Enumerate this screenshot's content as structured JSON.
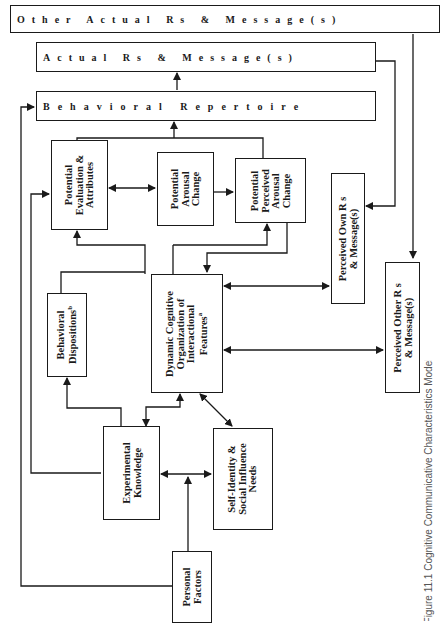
{
  "diagram": {
    "orientation": "rotated 90 degrees counter-clockwise",
    "boxes": {
      "other_actual": {
        "label": "Other Actual Rs & Message(s)"
      },
      "actual": {
        "label": "Actual Rs & Message(s)"
      },
      "repertoire": {
        "label": "Behavioral Repertoire"
      },
      "evaluation": {
        "lines": [
          "Potential",
          "Evaluation &",
          "Attributes"
        ]
      },
      "arousal": {
        "lines": [
          "Potential",
          "Arousal",
          "Change"
        ]
      },
      "perceived_arousal": {
        "lines": [
          "Potential",
          "Perceived",
          "Arousal",
          "Change"
        ]
      },
      "perceived_own": {
        "lines": [
          "Perceived Own R s",
          "& Message(s)"
        ]
      },
      "dispositions": {
        "lines": [
          "Behavioral",
          "Dispositions"
        ],
        "superscript": "b"
      },
      "dynamic": {
        "lines": [
          "Dynamic Cognitive",
          "Organization of",
          "Interactional",
          "Features"
        ],
        "superscript": "a"
      },
      "perceived_other": {
        "lines": [
          "Perceived Other R s",
          "& Message(s)"
        ]
      },
      "experimental": {
        "lines": [
          "Experimental",
          "Knowledge"
        ]
      },
      "self_identity": {
        "lines": [
          "Self-Identity &",
          "Social Influence",
          "Needs"
        ]
      },
      "personal": {
        "lines": [
          "Personal",
          "Factors"
        ]
      }
    },
    "caption": "Figure 11.1 Cognitive Communicative Characteristics Model"
  }
}
